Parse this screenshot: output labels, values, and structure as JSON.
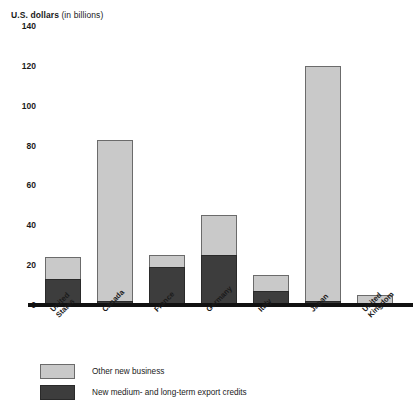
{
  "chart_data": {
    "type": "bar",
    "subtype": "stacked-vertical",
    "title": "U.S. dollars (in billions)",
    "title_bold_part": "U.S. dollars",
    "title_light_part": " (in billions)",
    "xlabel": "",
    "ylabel": "U.S. dollars (in billions)",
    "ylim": [
      0,
      140
    ],
    "yticks": [
      0,
      20,
      40,
      60,
      80,
      100,
      120,
      140
    ],
    "ytick_labels": [
      "0",
      "20",
      "40",
      "60",
      "80",
      "100",
      "120",
      "140"
    ],
    "grid": false,
    "legend_position": "below-plot-left",
    "categories": [
      "United States",
      "Canada",
      "France",
      "Germany",
      "Italy",
      "Japan",
      "United Kingdom"
    ],
    "category_lines": [
      [
        "United",
        "States"
      ],
      [
        "Canada"
      ],
      [
        "France"
      ],
      [
        "Germany"
      ],
      [
        "Italy"
      ],
      [
        "Japan"
      ],
      [
        "United",
        "Kingdom"
      ]
    ],
    "series": [
      {
        "name": "New medium- and long-term export credits",
        "color": "#3d3d3d",
        "values": [
          13,
          2,
          19,
          25,
          7,
          2,
          1
        ]
      },
      {
        "name": "Other new business",
        "color": "#c9c9c9",
        "values": [
          11,
          81,
          6,
          20,
          8,
          118,
          4
        ]
      }
    ],
    "totals": [
      24,
      83,
      25,
      45,
      15,
      120,
      5
    ]
  },
  "legend": {
    "items": [
      {
        "label": "Other new business",
        "swatch": "light"
      },
      {
        "label": "New medium- and long-term export credits",
        "swatch": "dark"
      }
    ]
  }
}
